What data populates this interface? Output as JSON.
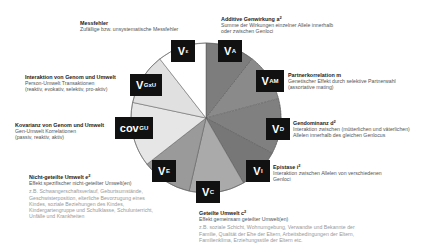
{
  "chart_data": {
    "type": "pie",
    "title": "",
    "center": [
      206,
      118
    ],
    "radius": 75,
    "segments": [
      {
        "key": "V_A",
        "start": 0,
        "end": 38,
        "color": "#7d7d7d"
      },
      {
        "key": "V_AM",
        "start": 38,
        "end": 75,
        "color": "#8a8a8a"
      },
      {
        "key": "V_D",
        "start": 75,
        "end": 118,
        "color": "#808080"
      },
      {
        "key": "V_I",
        "start": 118,
        "end": 150,
        "color": "#777777"
      },
      {
        "key": "V_C",
        "start": 150,
        "end": 193,
        "color": "#aaaaaa"
      },
      {
        "key": "V_E",
        "start": 193,
        "end": 232,
        "color": "#9a9a9a"
      },
      {
        "key": "COV_GU",
        "start": 232,
        "end": 282,
        "color": "#e6e6e6"
      },
      {
        "key": "V_GxU",
        "start": 282,
        "end": 322,
        "color": "#e0e0e0"
      },
      {
        "key": "V_eps",
        "start": 322,
        "end": 360,
        "color": "#ffffff"
      }
    ]
  },
  "boxes": {
    "v_eps": {
      "main": "V",
      "sub": "ε"
    },
    "v_a": {
      "main": "V",
      "sub": "A"
    },
    "v_am": {
      "main": "V",
      "sub": "AM"
    },
    "v_gxu": {
      "main": "V",
      "sub": "GxU"
    },
    "cov_gu": {
      "main": "cov",
      "sub": "GU"
    },
    "v_d": {
      "main": "V",
      "sub": "D"
    },
    "v_i": {
      "main": "V",
      "sub": "I"
    },
    "v_e": {
      "main": "V",
      "sub": "E"
    },
    "v_c": {
      "main": "V",
      "sub": "C"
    }
  },
  "labels": {
    "messfehler": {
      "title": "Messfehler",
      "desc": "Zufällige bzw. unsystematische Messfehler"
    },
    "additive": {
      "title": "Additive Genwirkung a",
      "sup": "2",
      "desc1": "Summe der Wirkungen einzelner Allele innerhalb",
      "desc2": "oder zwischen Genloci"
    },
    "interaktion": {
      "title": "Interaktion von Genom und Umwelt",
      "desc1": "Person-Umwelt Transaktionen",
      "desc2": "(reaktiv, evokativ, selektiv, pro-aktiv)"
    },
    "partner": {
      "title": "Partnerkorrelation m",
      "desc1": "Genetischer Effekt durch selektive Partnerwahl",
      "desc2": "(assortative mating)"
    },
    "kovarianz": {
      "title": "Kovarianz von Genom und Umwelt",
      "desc1": "Gen-Umwelt Korrelationen",
      "desc2": "(passiv, reaktiv, aktiv)"
    },
    "gendominanz": {
      "title": "Gendominanz d",
      "sup": "2",
      "desc1": "Interaktion zwischen (mütterlichen und väterlichen)",
      "desc2": "Allelen innerhalb des gleichen Genlocus"
    },
    "epistase": {
      "title": "Epistase i",
      "sup": "2",
      "desc1": "Interaktion zwischen Allelen von verschiedenen",
      "desc2": "Genloci"
    },
    "nichtgeteilt": {
      "title": "Nicht-geteilte Umwelt e",
      "sup": "2",
      "desc": "Effekt spezifischer nicht-geteilter Umwelt(en)",
      "ex1": "z.B. Schwangerschaftsverlauf, Geburtsumstände,",
      "ex2": "Geschwisterposition, elterliche Bevorzugung eines",
      "ex3": "Kindes, soziale Beziehungen des Kindes,",
      "ex4": "Kindergartengruppe und Schulklasse, Schulunterricht,",
      "ex5": "Unfälle und Krankheiten"
    },
    "geteilt": {
      "title": "Geteilte Umwelt c",
      "sup": "2",
      "desc": "Effekt gemeinsam geteilter Umwelt(en)",
      "ex1": "z.B. soziale Schicht, Wohnumgebung, Verwandte und Bekannte der",
      "ex2": "Familie, Qualität der Ehe der Eltern, Arbeitsbedingungen der Eltern,",
      "ex3": "Familienklima, Erziehungsstile der Eltern etc."
    }
  }
}
